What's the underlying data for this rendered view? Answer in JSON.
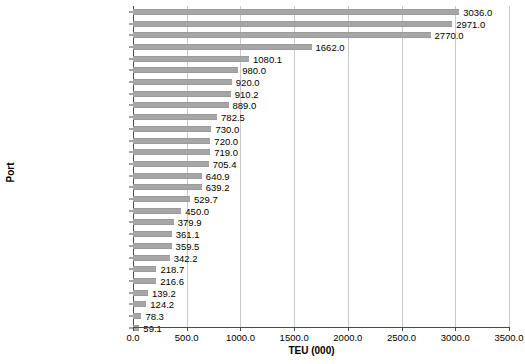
{
  "chart_data": {
    "type": "bar",
    "orientation": "horizontal",
    "title": "",
    "xlabel": "TEU (000)",
    "ylabel": "Port",
    "xlim": [
      0,
      3500
    ],
    "xticks": [
      "0.0",
      "500.0",
      "1000.0",
      "1500.0",
      "2000.0",
      "2500.0",
      "3000.0",
      "3500.0"
    ],
    "xtick_values": [
      0,
      500,
      1000,
      1500,
      2000,
      2500,
      3000,
      3500
    ],
    "grid": true,
    "legend": false,
    "bar_color": "#a6a6a6",
    "categories": [
      "Port Said",
      "Tanger-Med",
      "Durban",
      "Alexandria/El-Dekheila",
      "Mombasa",
      "Luanda",
      "Lagos",
      "Djibouti",
      "Cape Town",
      "Tema",
      "Algiers",
      "Point Noire",
      "Damietta",
      "Nyqura",
      "Abidjan",
      "Dar es Salaam",
      "Dakar",
      "Rades",
      "Douala",
      "Port Louis",
      "Walvis Bay",
      "Port Sudan",
      "Beira",
      "Port Elizabeth",
      "Toamasina",
      "Maputo",
      "Lobito",
      "Takoradi"
    ],
    "values": [
      3036.0,
      2971.0,
      2770.0,
      1662.0,
      1080.1,
      980.0,
      920.0,
      910.2,
      889.0,
      782.5,
      730.0,
      720.0,
      719.0,
      705.4,
      640.9,
      639.2,
      529.7,
      450.0,
      379.9,
      361.1,
      359.5,
      342.2,
      218.7,
      216.6,
      139.2,
      124.2,
      78.3,
      59.1
    ],
    "data_labels": [
      "3036.0",
      "2971.0",
      "2770.0",
      "1662.0",
      "1080.1",
      "980.0",
      "920.0",
      "910.2",
      "889.0",
      "782.5",
      "730.0",
      "720.0",
      "719.0",
      "705.4",
      "640.9",
      "639.2",
      "529.7",
      "450.0",
      "379.9",
      "361.1",
      "359.5",
      "342.2",
      "218.7",
      "216.6",
      "139.2",
      "124.2",
      "78.3",
      "59.1"
    ]
  }
}
